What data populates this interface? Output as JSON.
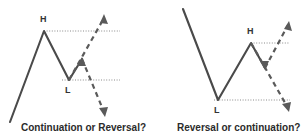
{
  "figure": {
    "background_color": "#ffffff",
    "line_color": "#4a4a4a",
    "projection_color": "#5a5a5a",
    "level_color": "#8a8a8a",
    "label_color": "#333333",
    "caption_color": "#2b2b2b"
  },
  "panels": [
    {
      "id": "left-panel",
      "caption": "Continuation or Reversal?",
      "pivots": [
        {
          "name": "high",
          "label": "H",
          "x": 44,
          "y": 31,
          "label_x": 40,
          "label_y": 22
        },
        {
          "name": "low",
          "label": "L",
          "x": 69,
          "y": 80,
          "label_x": 65,
          "label_y": 93
        }
      ],
      "price_path": "M 10,122 L 44,31 L 69,80 L 82,59",
      "levels": [
        {
          "name": "high-level",
          "d": "M 44,31 L 120,31"
        },
        {
          "name": "low-level",
          "d": "M 62,80 L 120,80"
        }
      ],
      "projections": [
        {
          "name": "bullish-continuation-arrow",
          "direction": "up",
          "d": "M 69,80 L 104,18",
          "head": "M 104,14 L 108,24 L 100,23 Z"
        },
        {
          "name": "bearish-reversal-arrow",
          "direction": "down",
          "d": "M 82,59 L 104,112",
          "head": "M 105,117 L 99,108 L 108,107 Z"
        }
      ],
      "inner_arrow": {
        "name": "swing-up-arrowhead",
        "head": "M 82,57 L 77,66 L 86,66 Z"
      }
    },
    {
      "id": "right-panel",
      "caption": "Reversal or continuation?",
      "pivots": [
        {
          "name": "low",
          "label": "L",
          "x": 218,
          "y": 100,
          "label_x": 214,
          "label_y": 113
        },
        {
          "name": "high",
          "label": "H",
          "x": 251,
          "y": 43,
          "label_x": 247,
          "label_y": 34
        }
      ],
      "price_path": "M 183,9 L 218,100 L 251,43 L 265,68",
      "levels": [
        {
          "name": "high-level",
          "d": "M 251,43 L 290,43"
        },
        {
          "name": "low-level",
          "d": "M 214,100 L 290,100"
        }
      ],
      "projections": [
        {
          "name": "bullish-continuation-arrow",
          "direction": "up",
          "d": "M 265,68 L 288,25",
          "head": "M 289,21 L 292,31 L 284,29 Z"
        },
        {
          "name": "bearish-reversal-arrow",
          "direction": "down",
          "d": "M 251,43 L 288,108",
          "head": "M 289,112 L 282,104 L 291,102 Z"
        }
      ],
      "inner_arrow": {
        "name": "swing-down-arrowhead",
        "head": "M 265,70 L 260,61 L 269,61 Z"
      }
    }
  ]
}
